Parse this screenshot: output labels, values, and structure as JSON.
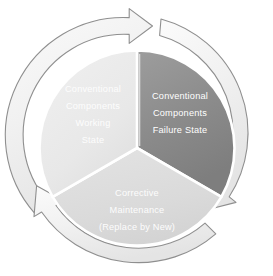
{
  "diagram": {
    "type": "cycle",
    "direction": "clockwise",
    "center": {
      "x": 137,
      "y": 148
    },
    "radius": 118,
    "colors": {
      "background": "#ffffff",
      "ring_fill": "#f2f2f2",
      "ring_stroke": "#9a9a9a",
      "divider": "#ffffff",
      "segment_dark": "#8c8c8c",
      "segment_light": "#e9e9e9",
      "segment_mid": "#dcdcdc",
      "label_text": "#ffffff"
    },
    "segments": [
      {
        "id": "working-state",
        "position": "left",
        "fill": "#e9e9e9",
        "start_angle": -90,
        "end_angle": -210,
        "label_lines": [
          "Conventional",
          "Components",
          "Working",
          "State"
        ]
      },
      {
        "id": "failure-state",
        "position": "right",
        "fill": "#8c8c8c",
        "start_angle": -90,
        "end_angle": 30,
        "label_lines": [
          "Conventional",
          "Components",
          "Failure State"
        ]
      },
      {
        "id": "corrective-maintenance",
        "position": "bottom",
        "fill": "#dcdcdc",
        "start_angle": 30,
        "end_angle": 150,
        "label_lines": [
          "Corrective",
          "Maintenance",
          "(Replace by New)"
        ]
      }
    ],
    "arrows": [
      {
        "id": "arrow-top",
        "points_to": "failure-state",
        "position": "top",
        "heading": "right"
      },
      {
        "id": "arrow-right",
        "points_to": "corrective-maintenance",
        "position": "lower-right",
        "heading": "down-left"
      },
      {
        "id": "arrow-left",
        "points_to": "working-state",
        "position": "lower-left",
        "heading": "up-left"
      }
    ]
  }
}
